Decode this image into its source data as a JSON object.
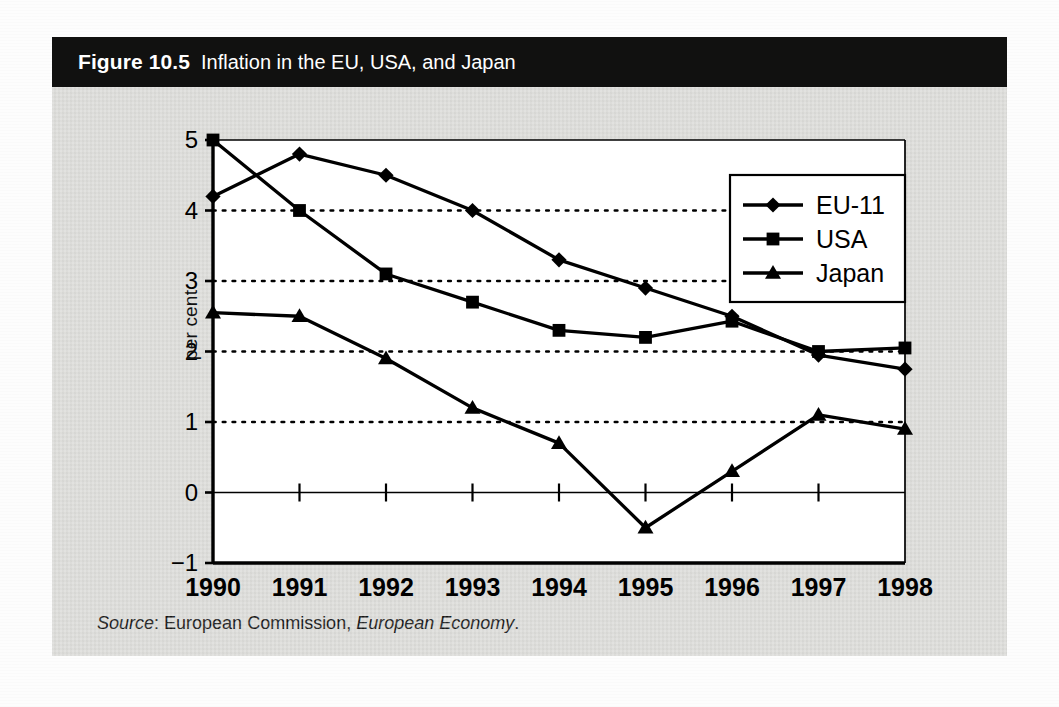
{
  "figure": {
    "number_label": "Figure 10.5",
    "title": "Inflation in the EU, USA, and Japan",
    "source_prefix": "Source",
    "source_sep": ": ",
    "source_publisher": "European Commission, ",
    "source_publication": "European Economy",
    "source_end": "."
  },
  "colors": {
    "banner_bg": "#111110",
    "banner_text": "#ffffff",
    "figure_bg": "#dcdcd9",
    "plot_bg": "#ffffff",
    "ink": "#000000",
    "page_bg": "#fdfdfd"
  },
  "chart_data": {
    "type": "line",
    "title": "Inflation in the EU, USA, and Japan",
    "xlabel": "",
    "ylabel": "per cent",
    "categories": [
      "1990",
      "1991",
      "1992",
      "1993",
      "1994",
      "1995",
      "1996",
      "1997",
      "1998"
    ],
    "x": [
      1990,
      1991,
      1992,
      1993,
      1994,
      1995,
      1996,
      1997,
      1998
    ],
    "ylim": [
      -1,
      5
    ],
    "yticks": [
      -1,
      0,
      1,
      2,
      3,
      4,
      5
    ],
    "ytick_labels": [
      "−1",
      "0",
      "1",
      "2",
      "3",
      "4",
      "5"
    ],
    "grid": "horizontal-dotted-at-1-2-3-4",
    "zero_line": true,
    "legend_position": "top-right-inside",
    "series": [
      {
        "name": "EU-11",
        "marker": "diamond",
        "values": [
          4.2,
          4.8,
          4.5,
          4.0,
          3.3,
          2.9,
          2.5,
          1.95,
          1.75
        ]
      },
      {
        "name": "USA",
        "marker": "square",
        "values": [
          5.0,
          4.0,
          3.1,
          2.7,
          2.3,
          2.2,
          2.43,
          2.0,
          2.05
        ]
      },
      {
        "name": "Japan",
        "marker": "triangle",
        "values": [
          2.55,
          2.5,
          1.9,
          1.2,
          0.7,
          -0.5,
          0.3,
          1.1,
          0.9
        ]
      }
    ]
  }
}
